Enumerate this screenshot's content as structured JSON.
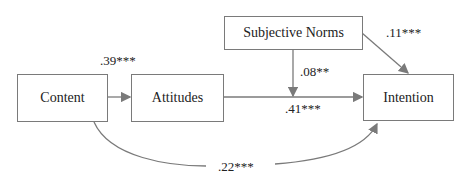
{
  "nodes": {
    "content": "Content",
    "attitudes": "Attitudes",
    "subjective_norms": "Subjective Norms",
    "intention": "Intention"
  },
  "paths": {
    "content_attitudes": ".39***",
    "attitudes_intention": ".41***",
    "norms_moderation": ".08**",
    "norms_intention": ".11***",
    "content_intention": ".22***"
  },
  "colors": {
    "line": "#7a7a7a",
    "text": "#222222"
  }
}
